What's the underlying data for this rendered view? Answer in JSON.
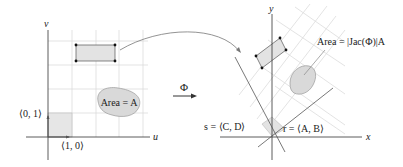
{
  "left_plane": {
    "axis_u_label": "u",
    "axis_v_label": "v",
    "basis_u_label": "⟨1, 0⟩",
    "basis_v_label": "⟨0, 1⟩",
    "region_label": "Area = A"
  },
  "map": {
    "label": "Φ"
  },
  "right_plane": {
    "axis_x_label": "x",
    "axis_y_label": "y",
    "vector_r_label": "r = ⟨A, B⟩",
    "vector_s_label": "s = ⟨C, D⟩",
    "region_label": "Area = |Jac(Φ)|A"
  },
  "colors": {
    "grid": "#dcdcdc",
    "fill": "#e6e6e6",
    "region_fill": "#d9d9d9",
    "axis": "#333333"
  }
}
